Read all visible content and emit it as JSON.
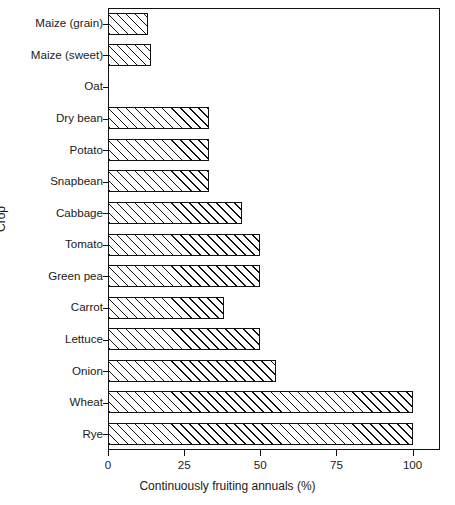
{
  "chart_data": {
    "type": "bar",
    "orientation": "horizontal",
    "title": "",
    "xlabel": "Continuously fruiting annuals (%)",
    "ylabel": "Crop",
    "categories": [
      "Maize (grain)",
      "Maize (sweet)",
      "Oat",
      "Dry bean",
      "Potato",
      "Snapbean",
      "Cabbage",
      "Tomato",
      "Green pea",
      "Carrot",
      "Lettuce",
      "Onion",
      "Wheat",
      "Rye"
    ],
    "values": [
      13,
      14,
      0,
      33,
      33,
      33,
      44,
      50,
      50,
      38,
      50,
      55,
      100,
      100
    ],
    "xlim": [
      0,
      109
    ],
    "xticks": [
      0,
      25,
      50,
      75,
      100
    ],
    "xtick_labels": [
      "0",
      "25",
      "50",
      "75",
      "100"
    ],
    "grid": false,
    "legend": null,
    "bar_fill": "#ffffff",
    "bar_edge_color": "#111111",
    "bar_hatch": "forward-diagonal",
    "background": "#ffffff"
  }
}
